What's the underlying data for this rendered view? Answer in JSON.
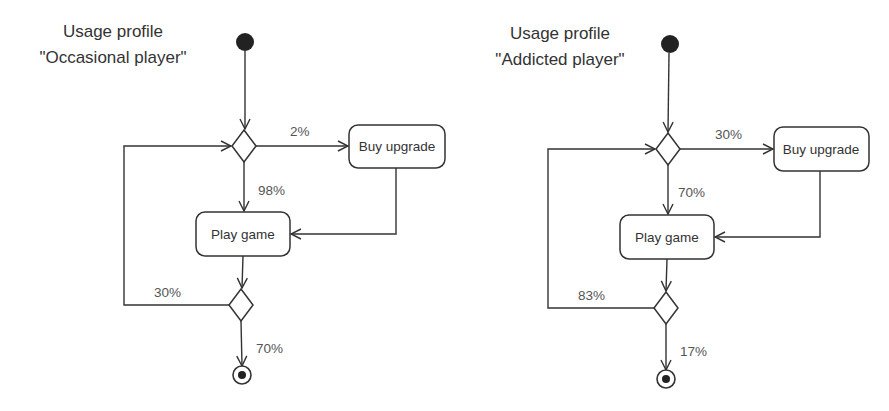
{
  "diagrams": [
    {
      "title_line1": "Usage profile",
      "title_line2": "\"Occasional player\"",
      "nodes": {
        "buy_upgrade": "Buy upgrade",
        "play_game": "Play game"
      },
      "edges": {
        "to_buy_upgrade": "2%",
        "to_play_game": "98%",
        "loop_back": "30%",
        "to_end": "70%"
      }
    },
    {
      "title_line1": "Usage profile",
      "title_line2": "\"Addicted player\"",
      "nodes": {
        "buy_upgrade": "Buy upgrade",
        "play_game": "Play game"
      },
      "edges": {
        "to_buy_upgrade": "30%",
        "to_play_game": "70%",
        "loop_back": "83%",
        "to_end": "17%"
      }
    }
  ],
  "colors": {
    "stroke": "#333333",
    "text": "#333333",
    "label": "#555555",
    "background": "#ffffff"
  }
}
